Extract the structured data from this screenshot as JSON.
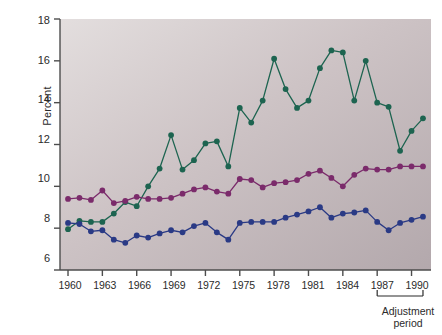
{
  "chart_data": {
    "type": "line",
    "title": "",
    "xlabel": "",
    "ylabel": "Percent",
    "xlim": [
      1959.3,
      1991.7
    ],
    "ylim": [
      6,
      18
    ],
    "yticks": [
      6,
      8,
      10,
      12,
      14,
      16,
      18
    ],
    "ytick_labels": [
      "6",
      "8",
      "10",
      "12",
      "14",
      "16",
      "18"
    ],
    "xticks": [
      1960,
      1963,
      1966,
      1969,
      1972,
      1975,
      1978,
      1981,
      1984,
      1987,
      1990
    ],
    "xtick_labels": [
      "1960",
      "1963",
      "1966",
      "1969",
      "1972",
      "1975",
      "1978",
      "1981",
      "1984",
      "1987",
      "1990"
    ],
    "x": [
      1960,
      1961,
      1962,
      1963,
      1964,
      1965,
      1966,
      1967,
      1968,
      1969,
      1970,
      1971,
      1972,
      1973,
      1974,
      1975,
      1976,
      1977,
      1978,
      1979,
      1980,
      1981,
      1982,
      1983,
      1984,
      1985,
      1986,
      1987,
      1988,
      1989,
      1990,
      1991
    ],
    "grid": false,
    "legend_position": "inline-annotations",
    "series": [
      {
        "name": "Africa South of Sahara",
        "color": "#1d6450",
        "values": [
          7.95,
          8.35,
          8.3,
          8.3,
          8.7,
          9.25,
          9.05,
          10.0,
          10.85,
          12.45,
          10.8,
          11.25,
          12.05,
          12.15,
          10.95,
          13.75,
          13.05,
          14.1,
          16.1,
          14.65,
          13.75,
          14.1,
          15.65,
          16.5,
          16.4,
          14.1,
          16.0,
          14.0,
          13.8,
          11.7,
          12.65,
          13.25
        ]
      },
      {
        "name": "Twenty-six other developing countries",
        "color": "#7b2b6b",
        "values": [
          9.4,
          9.45,
          9.35,
          9.8,
          9.2,
          9.3,
          9.5,
          9.4,
          9.4,
          9.45,
          9.65,
          9.85,
          9.95,
          9.75,
          9.65,
          10.35,
          10.3,
          9.95,
          10.15,
          10.2,
          10.3,
          10.6,
          10.75,
          10.4,
          10.0,
          10.55,
          10.85,
          10.8,
          10.8,
          10.95,
          10.95,
          10.95
        ]
      },
      {
        "name": "East Asia and the Pacific",
        "color": "#2a3a85",
        "values": [
          8.25,
          8.2,
          7.85,
          7.9,
          7.45,
          7.3,
          7.65,
          7.55,
          7.75,
          7.9,
          7.8,
          8.1,
          8.25,
          7.8,
          7.45,
          8.25,
          8.3,
          8.3,
          8.3,
          8.5,
          8.65,
          8.8,
          9.0,
          8.5,
          8.7,
          8.75,
          8.85,
          8.3,
          7.9,
          8.25,
          8.4,
          8.55
        ]
      }
    ],
    "annotations": [
      {
        "text": "Africa South of Sahara",
        "color": "#1d6450"
      },
      {
        "text": "Twenty-six other",
        "color": "#7b2b6b"
      },
      {
        "text": "developing countries",
        "color": "#7b2b6b"
      },
      {
        "text": "East Asia and the Pacific",
        "color": "#2a3a85"
      }
    ],
    "bracket": {
      "label_line1": "Adjustment",
      "label_line2": "period",
      "start_year": 1987,
      "end_year": 1991
    }
  }
}
